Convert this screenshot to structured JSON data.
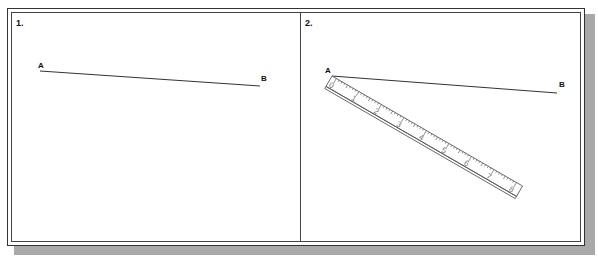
{
  "figure": {
    "panels": [
      {
        "number": "1.",
        "point_a_label": "A",
        "point_b_label": "B"
      },
      {
        "number": "2.",
        "point_a_label": "A",
        "point_b_label": "B",
        "ruler": {
          "labels": [
            "0",
            "1",
            "2",
            "3",
            "4",
            "5",
            "6",
            "7",
            "8"
          ]
        }
      }
    ],
    "colors": {
      "line": "#333333",
      "shadow": "#a9a9a9",
      "ruler_text": "#777777"
    }
  }
}
